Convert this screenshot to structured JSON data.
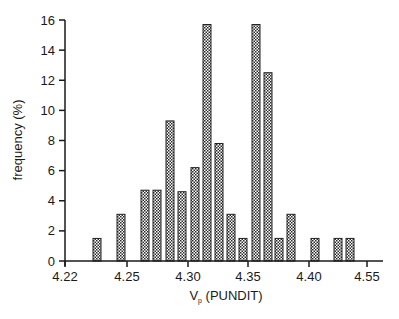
{
  "chart_data": {
    "type": "bar",
    "title": "",
    "xlabel": "V_p (PUNDIT)",
    "xlabel_main": "V",
    "xlabel_sub": "p",
    "xlabel_rest": " (PUNDIT)",
    "ylabel": "frequency (%)",
    "ylim": [
      0,
      16
    ],
    "yticks": [
      0,
      2,
      4,
      6,
      8,
      10,
      12,
      14,
      16
    ],
    "xticks": [
      {
        "label": "4.22",
        "px": 65
      },
      {
        "label": "4.25",
        "px": 127
      },
      {
        "label": "4.30",
        "px": 188
      },
      {
        "label": "4.35",
        "px": 248
      },
      {
        "label": "4.40",
        "px": 309
      },
      {
        "label": "4.55",
        "px": 367
      }
    ],
    "grid": false,
    "legend": null,
    "bar_pattern": "crosshatch",
    "bars": [
      {
        "x": 4.247,
        "value": 1.5
      },
      {
        "x": 4.266,
        "value": 3.1
      },
      {
        "x": 4.286,
        "value": 4.7
      },
      {
        "x": 4.296,
        "value": 4.7
      },
      {
        "x": 4.307,
        "value": 9.3
      },
      {
        "x": 4.316,
        "value": 4.6
      },
      {
        "x": 4.327,
        "value": 6.2
      },
      {
        "x": 4.337,
        "value": 15.7
      },
      {
        "x": 4.347,
        "value": 7.8
      },
      {
        "x": 4.357,
        "value": 3.1
      },
      {
        "x": 4.366,
        "value": 1.5
      },
      {
        "x": 4.377,
        "value": 15.7
      },
      {
        "x": 4.387,
        "value": 12.5
      },
      {
        "x": 4.396,
        "value": 1.5
      },
      {
        "x": 4.406,
        "value": 3.1
      },
      {
        "x": 4.426,
        "value": 1.5
      },
      {
        "x": 4.445,
        "value": 1.5
      },
      {
        "x": 4.455,
        "value": 1.5
      }
    ],
    "bar_px_centers": [
      97,
      121,
      145,
      157,
      170,
      182,
      195,
      207,
      219,
      231,
      243,
      256,
      268,
      279,
      291,
      315,
      338,
      350
    ],
    "values": [
      1.5,
      3.1,
      4.7,
      4.7,
      9.3,
      4.6,
      6.2,
      15.7,
      7.8,
      3.1,
      1.5,
      15.7,
      12.5,
      1.5,
      3.1,
      1.5,
      1.5,
      1.5
    ]
  }
}
